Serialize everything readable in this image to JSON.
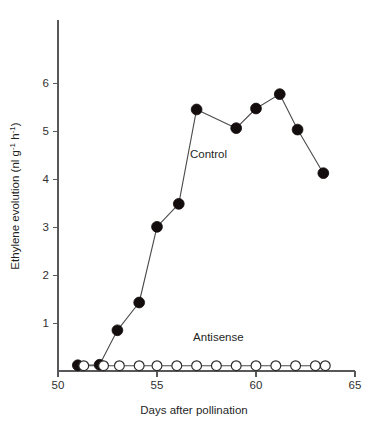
{
  "chart_data": {
    "type": "line",
    "title": "",
    "xlabel": "Days after pollination",
    "ylabel": "Ethylene evolution (nl g-1 h-1)",
    "ylabel_parts": {
      "prefix": "Ethylene evolution (nl g",
      "sup1": "-1",
      "mid": " h",
      "sup2": "-1",
      "suffix": ")"
    },
    "xlim": [
      50,
      65
    ],
    "ylim": [
      0,
      6.5
    ],
    "xticks": [
      50,
      55,
      60,
      65
    ],
    "xticklabels": [
      "50",
      "55",
      "60",
      "65"
    ],
    "yticks": [
      1,
      2,
      3,
      4,
      5,
      6
    ],
    "yticklabels": [
      "1",
      "2",
      "3",
      "4",
      "5",
      "6"
    ],
    "grid": false,
    "legend_position": "inline-annotation",
    "series": [
      {
        "name": "Control",
        "marker": "filled-circle",
        "color": "#140d0d",
        "label_x": 57.6,
        "label_y": 4.45,
        "x": [
          51.0,
          52.1,
          53.0,
          54.1,
          55.0,
          56.1,
          57.0,
          59.0,
          60.0,
          61.2,
          62.1,
          63.4
        ],
        "y": [
          0.12,
          0.13,
          0.85,
          1.43,
          3.01,
          3.49,
          5.46,
          5.07,
          5.48,
          5.78,
          5.04,
          4.13
        ]
      },
      {
        "name": "Antisense",
        "marker": "open-circle",
        "color": "#ffffff",
        "label_x": 58.1,
        "label_y": 0.62,
        "x": [
          51.3,
          52.3,
          53.1,
          54.1,
          55.0,
          56.0,
          57.0,
          58.0,
          59.0,
          60.0,
          61.0,
          62.0,
          63.0,
          63.5
        ],
        "y": [
          0.11,
          0.11,
          0.11,
          0.11,
          0.11,
          0.11,
          0.11,
          0.11,
          0.11,
          0.11,
          0.11,
          0.11,
          0.11,
          0.11
        ]
      }
    ]
  },
  "figure": {
    "background_color": "#ffffff",
    "axis_color": "#58585a",
    "line_color": "#4a4a4a"
  }
}
